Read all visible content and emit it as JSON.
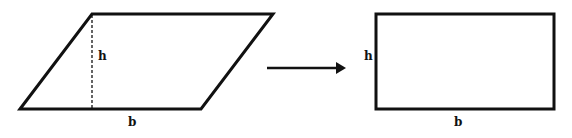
{
  "diagram": {
    "parallelogram": {
      "height_label": "h",
      "base_label": "b",
      "points": "20,109 92,14 273,14 201,109",
      "height_line": {
        "x": 92,
        "y1": 14,
        "y2": 109
      }
    },
    "arrow": {
      "x1": 267,
      "x2": 346,
      "y": 68
    },
    "rectangle": {
      "height_label": "h",
      "base_label": "b",
      "x": 376,
      "y": 14,
      "width": 178,
      "height": 95
    },
    "colors": {
      "stroke": "#111111",
      "background": "#ffffff"
    }
  }
}
